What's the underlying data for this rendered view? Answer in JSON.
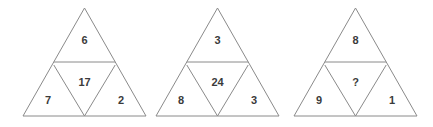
{
  "figure": {
    "kind": "triangle-number-puzzle",
    "triangle_count": 3,
    "line_color": "#8a8a8a",
    "text_color": "#3b3b3b",
    "background_color": "#ffffff"
  },
  "triangles": [
    {
      "name": "triangle-1",
      "top": "6",
      "center": "17",
      "bottom_left": "7",
      "bottom_right": "2"
    },
    {
      "name": "triangle-2",
      "top": "3",
      "center": "24",
      "bottom_left": "8",
      "bottom_right": "3"
    },
    {
      "name": "triangle-3",
      "top": "8",
      "center": "?",
      "bottom_left": "9",
      "bottom_right": "1"
    }
  ]
}
